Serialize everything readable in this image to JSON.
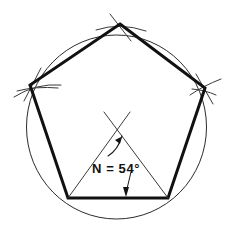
{
  "figure": {
    "title": "Pentagon inscribed in circle with central angle construction",
    "annotation": {
      "label": "N = 54°",
      "angle_value": 54,
      "angle_unit": "degrees",
      "variable_name": "N"
    },
    "colors": {
      "background": "#ffffff",
      "circle": "#2b2b2b",
      "polygon": "#111111",
      "construction": "#3a3a3a",
      "text": "#111111"
    },
    "geometry": {
      "circle": {
        "cx": 116,
        "cy": 127,
        "r": 91
      },
      "polygon_sides": 5,
      "polygon_vertices": [
        {
          "name": "top",
          "x": 120,
          "y": 24
        },
        {
          "name": "right",
          "x": 205,
          "y": 88
        },
        {
          "name": "bottom-right",
          "x": 168,
          "y": 198
        },
        {
          "name": "bottom-left",
          "x": 68,
          "y": 198
        },
        {
          "name": "left",
          "x": 30,
          "y": 85
        }
      ],
      "triangle_apex": {
        "x": 116,
        "y": 127
      },
      "base_midpoint": {
        "x": 118,
        "y": 198
      }
    }
  }
}
